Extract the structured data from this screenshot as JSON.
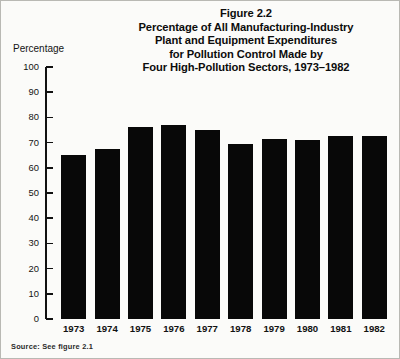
{
  "figure": {
    "title_lines": [
      "Figure 2.2",
      "Percentage of All Manufacturing-Industry",
      "Plant and Equipment Expenditures",
      "for Pollution Control Made by",
      "Four High-Pollution Sectors, 1973–1982"
    ],
    "y_axis_title": "Percentage",
    "source_note": "Source: See figure 2.1"
  },
  "chart_data": {
    "type": "bar",
    "title": "Figure 2.2 Percentage of All Manufacturing-Industry Plant and Equipment Expenditures for Pollution Control Made by Four High-Pollution Sectors, 1973–1982",
    "xlabel": "",
    "ylabel": "Percentage",
    "ylim": [
      0,
      100
    ],
    "yticks": [
      0,
      10,
      20,
      30,
      40,
      50,
      60,
      70,
      80,
      90,
      100
    ],
    "ytick_labels": [
      "0",
      "10",
      "20",
      "30",
      "40",
      "50",
      "60",
      "70",
      "80",
      "90",
      "100"
    ],
    "grid": false,
    "legend": "none",
    "bar_color": "#080808",
    "categories": [
      "1973",
      "1974",
      "1975",
      "1976",
      "1977",
      "1978",
      "1979",
      "1980",
      "1981",
      "1982"
    ],
    "values": [
      65,
      67.5,
      76,
      77,
      75,
      69.5,
      71.5,
      71,
      72.5,
      72.5
    ]
  }
}
